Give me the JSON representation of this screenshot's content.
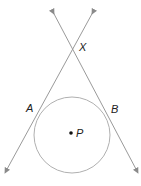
{
  "diagram": {
    "type": "geometry",
    "labels": {
      "x": "X",
      "a": "A",
      "b": "B",
      "p": "P"
    },
    "colors": {
      "line": "#9a9a9a",
      "circle": "#b0b0b0",
      "text": "#222222"
    }
  }
}
